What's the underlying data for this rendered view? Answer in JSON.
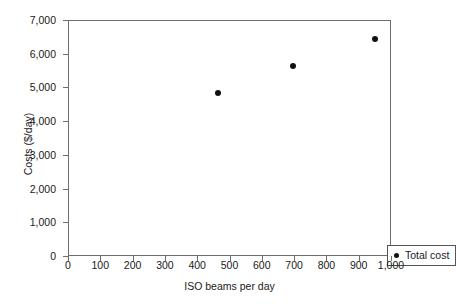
{
  "chart_data": {
    "type": "scatter",
    "title": "",
    "xlabel": "ISO beams per day",
    "ylabel": "Costs ($/day)",
    "xlim": [
      0,
      1000
    ],
    "ylim": [
      0,
      7000
    ],
    "grid": false,
    "legend_position": "inside bottom-right",
    "x_ticks": [
      0,
      100,
      200,
      300,
      400,
      500,
      600,
      700,
      800,
      900,
      1000
    ],
    "x_tick_labels": [
      "0",
      "100",
      "200",
      "300",
      "400",
      "500",
      "600",
      "700",
      "800",
      "900",
      "1,000"
    ],
    "y_ticks": [
      0,
      1000,
      2000,
      3000,
      4000,
      5000,
      6000,
      7000
    ],
    "y_tick_labels": [
      "0",
      "1,000",
      "2,000",
      "3,000",
      "4,000",
      "5,000",
      "6,000",
      "7,000"
    ],
    "series": [
      {
        "name": "Total cost",
        "marker": "circle",
        "color": "#111111",
        "points": [
          {
            "x": 461,
            "y": 4870
          },
          {
            "x": 694,
            "y": 5670
          },
          {
            "x": 947,
            "y": 6470
          }
        ]
      }
    ]
  },
  "legend": {
    "entries": [
      {
        "label": "Total cost",
        "marker_color": "#111111"
      }
    ]
  },
  "colors": {
    "axis": "#6e6e6e",
    "marker": "#111111",
    "text": "#1a1a1a",
    "background": "#ffffff",
    "legend_border": "#555555"
  }
}
